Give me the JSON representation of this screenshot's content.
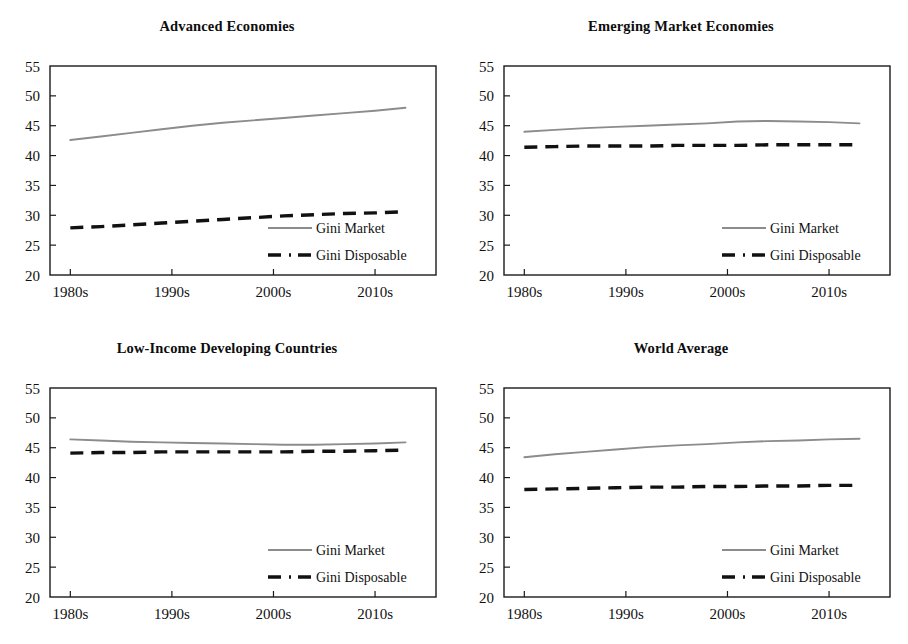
{
  "figure": {
    "background": "#ffffff",
    "panel_count": 4,
    "series_colors": {
      "gini_market": "#8c8c8c",
      "gini_disposable": "#111111"
    },
    "axis_color": "#1a1a1a"
  },
  "legend": {
    "gini_market_label": "Gini Market",
    "gini_disposable_label": "Gini Disposable"
  },
  "axes": {
    "y_ticks": [
      "20",
      "25",
      "30",
      "35",
      "40",
      "45",
      "50",
      "55"
    ],
    "x_ticks": [
      "1980s",
      "1990s",
      "2000s",
      "2010s"
    ]
  },
  "panels": {
    "p1": {
      "title": "Advanced Economies"
    },
    "p2": {
      "title": "Emerging Market Economies"
    },
    "p3": {
      "title": "Low-Income Developing Countries"
    },
    "p4": {
      "title": "World Average"
    }
  },
  "chart_data": [
    {
      "type": "line",
      "title": "Advanced Economies",
      "xlabel": "",
      "ylabel": "",
      "xlim": [
        1978,
        2016
      ],
      "ylim": [
        20,
        55
      ],
      "grid": false,
      "legend_position": "lower-right-inside",
      "categories": [
        "1980s",
        "1990s",
        "2000s",
        "2010s"
      ],
      "x": [
        1980,
        1983,
        1986,
        1989,
        1992,
        1995,
        1998,
        2001,
        2004,
        2007,
        2010,
        2013
      ],
      "series": [
        {
          "name": "Gini Market",
          "style": "solid",
          "color": "#8c8c8c",
          "values": [
            42.6,
            43.2,
            43.8,
            44.4,
            45.0,
            45.5,
            45.9,
            46.3,
            46.7,
            47.1,
            47.5,
            48.0
          ]
        },
        {
          "name": "Gini Disposable",
          "style": "dashed",
          "color": "#111111",
          "values": [
            27.9,
            28.1,
            28.4,
            28.7,
            29.0,
            29.3,
            29.6,
            29.9,
            30.1,
            30.3,
            30.4,
            30.6
          ]
        }
      ]
    },
    {
      "type": "line",
      "title": "Emerging Market Economies",
      "xlabel": "",
      "ylabel": "",
      "xlim": [
        1978,
        2016
      ],
      "ylim": [
        20,
        55
      ],
      "grid": false,
      "legend_position": "lower-right-inside",
      "categories": [
        "1980s",
        "1990s",
        "2000s",
        "2010s"
      ],
      "x": [
        1980,
        1983,
        1986,
        1989,
        1992,
        1995,
        1998,
        2001,
        2004,
        2007,
        2010,
        2013
      ],
      "series": [
        {
          "name": "Gini Market",
          "style": "solid",
          "color": "#8c8c8c",
          "values": [
            44.0,
            44.3,
            44.6,
            44.8,
            45.0,
            45.2,
            45.4,
            45.7,
            45.8,
            45.7,
            45.6,
            45.4
          ]
        },
        {
          "name": "Gini Disposable",
          "style": "dashed",
          "color": "#111111",
          "values": [
            41.4,
            41.5,
            41.6,
            41.6,
            41.6,
            41.7,
            41.7,
            41.7,
            41.8,
            41.8,
            41.8,
            41.8
          ]
        }
      ]
    },
    {
      "type": "line",
      "title": "Low-Income Developing Countries",
      "xlabel": "",
      "ylabel": "",
      "xlim": [
        1978,
        2016
      ],
      "ylim": [
        20,
        55
      ],
      "grid": false,
      "legend_position": "lower-right-inside",
      "categories": [
        "1980s",
        "1990s",
        "2000s",
        "2010s"
      ],
      "x": [
        1980,
        1983,
        1986,
        1989,
        1992,
        1995,
        1998,
        2001,
        2004,
        2007,
        2010,
        2013
      ],
      "series": [
        {
          "name": "Gini Market",
          "style": "solid",
          "color": "#8c8c8c",
          "values": [
            46.4,
            46.2,
            46.0,
            45.9,
            45.8,
            45.7,
            45.6,
            45.5,
            45.5,
            45.6,
            45.7,
            45.9
          ]
        },
        {
          "name": "Gini Disposable",
          "style": "dashed",
          "color": "#111111",
          "values": [
            44.1,
            44.2,
            44.2,
            44.3,
            44.3,
            44.3,
            44.3,
            44.3,
            44.4,
            44.4,
            44.5,
            44.6
          ]
        }
      ]
    },
    {
      "type": "line",
      "title": "World Average",
      "xlabel": "",
      "ylabel": "",
      "xlim": [
        1978,
        2016
      ],
      "ylim": [
        20,
        55
      ],
      "grid": false,
      "legend_position": "lower-right-inside",
      "categories": [
        "1980s",
        "1990s",
        "2000s",
        "2010s"
      ],
      "x": [
        1980,
        1983,
        1986,
        1989,
        1992,
        1995,
        1998,
        2001,
        2004,
        2007,
        2010,
        2013
      ],
      "series": [
        {
          "name": "Gini Market",
          "style": "solid",
          "color": "#8c8c8c",
          "values": [
            43.4,
            43.9,
            44.3,
            44.7,
            45.1,
            45.4,
            45.6,
            45.9,
            46.1,
            46.2,
            46.4,
            46.5
          ]
        },
        {
          "name": "Gini Disposable",
          "style": "dashed",
          "color": "#111111",
          "values": [
            38.0,
            38.1,
            38.2,
            38.3,
            38.4,
            38.4,
            38.5,
            38.5,
            38.6,
            38.6,
            38.7,
            38.7
          ]
        }
      ]
    }
  ]
}
